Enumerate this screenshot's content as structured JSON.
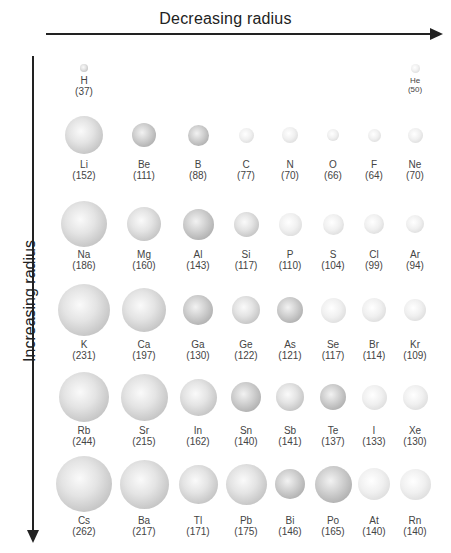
{
  "axes": {
    "top_label": "Decreasing radius",
    "left_label": "Increasing radius"
  },
  "chart_data": {
    "type": "diagram",
    "xlabel": "Decreasing radius",
    "ylabel": "Increasing radius",
    "rows": [
      [
        {
          "symbol": "H",
          "radius": 37
        },
        {
          "symbol": "He",
          "radius": 50
        }
      ],
      [
        {
          "symbol": "Li",
          "radius": 152
        },
        {
          "symbol": "Be",
          "radius": 111
        },
        {
          "symbol": "B",
          "radius": 88
        },
        {
          "symbol": "C",
          "radius": 77
        },
        {
          "symbol": "N",
          "radius": 70
        },
        {
          "symbol": "O",
          "radius": 66
        },
        {
          "symbol": "F",
          "radius": 64
        },
        {
          "symbol": "Ne",
          "radius": 70
        }
      ],
      [
        {
          "symbol": "Na",
          "radius": 186
        },
        {
          "symbol": "Mg",
          "radius": 160
        },
        {
          "symbol": "Al",
          "radius": 143
        },
        {
          "symbol": "Si",
          "radius": 117
        },
        {
          "symbol": "P",
          "radius": 110
        },
        {
          "symbol": "S",
          "radius": 104
        },
        {
          "symbol": "Cl",
          "radius": 99
        },
        {
          "symbol": "Ar",
          "radius": 94
        }
      ],
      [
        {
          "symbol": "K",
          "radius": 231
        },
        {
          "symbol": "Ca",
          "radius": 197
        },
        {
          "symbol": "Ga",
          "radius": 130
        },
        {
          "symbol": "Ge",
          "radius": 122
        },
        {
          "symbol": "As",
          "radius": 121
        },
        {
          "symbol": "Se",
          "radius": 117
        },
        {
          "symbol": "Br",
          "radius": 114
        },
        {
          "symbol": "Kr",
          "radius": 109
        }
      ],
      [
        {
          "symbol": "Rb",
          "radius": 244
        },
        {
          "symbol": "Sr",
          "radius": 215
        },
        {
          "symbol": "In",
          "radius": 162
        },
        {
          "symbol": "Sn",
          "radius": 140
        },
        {
          "symbol": "Sb",
          "radius": 141
        },
        {
          "symbol": "Te",
          "radius": 137
        },
        {
          "symbol": "I",
          "radius": 133
        },
        {
          "symbol": "Xe",
          "radius": 130
        }
      ],
      [
        {
          "symbol": "Cs",
          "radius": 262
        },
        {
          "symbol": "Ba",
          "radius": 217
        },
        {
          "symbol": "Tl",
          "radius": 171
        },
        {
          "symbol": "Pb",
          "radius": 175
        },
        {
          "symbol": "Bi",
          "radius": 146
        },
        {
          "symbol": "Po",
          "radius": 165
        },
        {
          "symbol": "At",
          "radius": 140
        },
        {
          "symbol": "Rn",
          "radius": 140
        }
      ]
    ]
  },
  "layout": {
    "col_x": [
      84,
      144,
      198,
      246,
      290,
      333,
      374,
      415
    ],
    "row_center_y": [
      68,
      135,
      224,
      310,
      397,
      484
    ],
    "row_label_y": [
      76,
      160,
      250,
      340,
      426,
      516
    ],
    "diameters": [
      [
        8,
        9
      ],
      [
        38,
        24,
        21,
        15,
        16,
        12,
        13,
        15
      ],
      [
        46,
        34,
        31,
        25,
        23,
        21,
        20,
        18
      ],
      [
        52,
        44,
        30,
        28,
        26,
        25,
        24,
        22
      ],
      [
        50,
        47,
        37,
        30,
        28,
        26,
        25,
        25
      ],
      [
        56,
        49,
        39,
        41,
        30,
        37,
        32,
        31
      ]
    ],
    "shades": [
      [
        "normal",
        "light"
      ],
      [
        "normal",
        "dark",
        "dark",
        "light",
        "light",
        "light",
        "light",
        "light"
      ],
      [
        "normal",
        "normal",
        "dark",
        "normal",
        "light",
        "light",
        "light",
        "light"
      ],
      [
        "normal",
        "normal",
        "dark",
        "normal",
        "dark",
        "light",
        "light",
        "light"
      ],
      [
        "normal",
        "normal",
        "normal",
        "dark",
        "normal",
        "dark",
        "light",
        "light"
      ],
      [
        "normal",
        "normal",
        "normal",
        "normal",
        "dark",
        "dark",
        "light",
        "light"
      ]
    ]
  }
}
